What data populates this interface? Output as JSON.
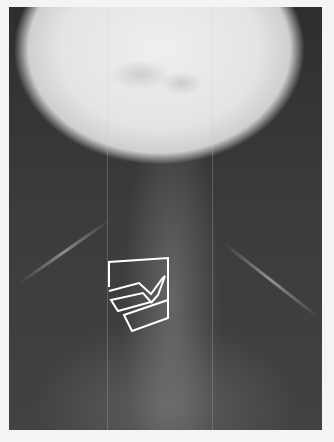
{
  "image": {
    "description": "Frontal neck X-ray with white outlined region annotations",
    "annotation_color": "#ffffff",
    "annotations": [
      {
        "name": "upper-box",
        "points": "100,263 168,257 168,283 148,296 118,290 100,297"
      },
      {
        "name": "middle-quadrilateral",
        "points": "101,299 142,292 151,302 108,311"
      },
      {
        "name": "lower-quadrilateral",
        "points": "115,315 165,295 166,308 124,327"
      },
      {
        "name": "arrow-wedge",
        "points": "152,303 165,280 158,296"
      }
    ]
  }
}
